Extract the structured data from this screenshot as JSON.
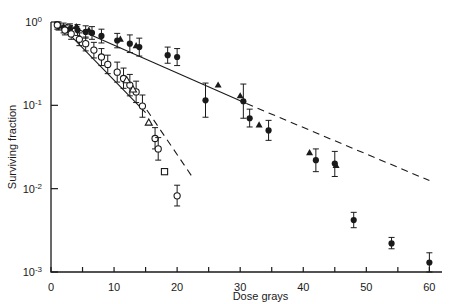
{
  "figure": {
    "background": "#ffffff",
    "ink": "#1a1a1a"
  },
  "axes": {
    "x": {
      "label": "Dose  grays",
      "min": 0,
      "max": 62,
      "tick_step": 5,
      "labeled_ticks": [
        0,
        10,
        20,
        30,
        40,
        50,
        60
      ],
      "labeled_tick_text": [
        "0",
        "10",
        "20",
        "30",
        "40",
        "50",
        "60"
      ]
    },
    "y": {
      "label": "Surviving fraction",
      "scale": "log10",
      "min": 0.001,
      "max": 1.0,
      "decade_ticks": [
        1,
        0.1,
        0.01,
        0.001
      ],
      "decade_tick_text": [
        "10⁰",
        "10⁻¹",
        "10⁻²",
        "10⁻³"
      ],
      "mantissa": [
        "0",
        "-1",
        "-2",
        "-3"
      ]
    }
  },
  "chart_data": {
    "type": "scatter",
    "title": "",
    "xlabel": "Dose  grays",
    "ylabel": "Surviving fraction",
    "xlim": [
      0,
      62
    ],
    "ylim": [
      0.001,
      1.0
    ],
    "yscale": "log",
    "grid": false,
    "legend": "none",
    "series": [
      {
        "name": "resistant-filled-circles",
        "marker": "filled-circle",
        "points": [
          {
            "x": 1.2,
            "y": 0.9,
            "yerr_lo": 0.8,
            "yerr_hi": 1.0
          },
          {
            "x": 2.0,
            "y": 0.85,
            "yerr_lo": 0.74,
            "yerr_hi": 0.97
          },
          {
            "x": 3.0,
            "y": 0.82,
            "yerr_lo": 0.71,
            "yerr_hi": 0.95
          },
          {
            "x": 4.2,
            "y": 0.8,
            "yerr_lo": 0.69,
            "yerr_hi": 0.93
          },
          {
            "x": 5.5,
            "y": 0.76,
            "yerr_lo": 0.64,
            "yerr_hi": 0.9
          },
          {
            "x": 6.5,
            "y": 0.74,
            "yerr_lo": 0.62,
            "yerr_hi": 0.88
          },
          {
            "x": 8.0,
            "y": 0.68,
            "yerr_lo": 0.56,
            "yerr_hi": 0.82
          },
          {
            "x": 10.5,
            "y": 0.6,
            "yerr_lo": 0.49,
            "yerr_hi": 0.73
          },
          {
            "x": 12.5,
            "y": 0.55,
            "yerr_lo": 0.43,
            "yerr_hi": 0.7
          },
          {
            "x": 14.0,
            "y": 0.5,
            "yerr_lo": 0.39,
            "yerr_hi": 0.64
          },
          {
            "x": 18.5,
            "y": 0.4,
            "yerr_lo": 0.32,
            "yerr_hi": 0.5
          },
          {
            "x": 20.0,
            "y": 0.38,
            "yerr_lo": 0.3,
            "yerr_hi": 0.48
          },
          {
            "x": 24.5,
            "y": 0.115,
            "yerr_lo": 0.072,
            "yerr_hi": 0.185
          },
          {
            "x": 30.5,
            "y": 0.112,
            "yerr_lo": 0.07,
            "yerr_hi": 0.18
          },
          {
            "x": 31.5,
            "y": 0.07,
            "yerr_lo": 0.055,
            "yerr_hi": 0.09
          },
          {
            "x": 34.5,
            "y": 0.05,
            "yerr_lo": 0.038,
            "yerr_hi": 0.066
          },
          {
            "x": 42.0,
            "y": 0.022,
            "yerr_lo": 0.016,
            "yerr_hi": 0.03
          },
          {
            "x": 45.0,
            "y": 0.02,
            "yerr_lo": 0.014,
            "yerr_hi": 0.028
          },
          {
            "x": 48.0,
            "y": 0.0042,
            "yerr_lo": 0.0034,
            "yerr_hi": 0.0052
          },
          {
            "x": 54.0,
            "y": 0.0022,
            "yerr_lo": 0.0019,
            "yerr_hi": 0.0026
          },
          {
            "x": 60.0,
            "y": 0.0013,
            "yerr_lo": 0.001,
            "yerr_hi": 0.0017
          }
        ]
      },
      {
        "name": "resistant-filled-triangles",
        "marker": "filled-triangle",
        "points": [
          {
            "x": 4.0,
            "y": 0.88
          },
          {
            "x": 6.0,
            "y": 0.8
          },
          {
            "x": 11.0,
            "y": 0.62
          },
          {
            "x": 13.5,
            "y": 0.52
          },
          {
            "x": 26.5,
            "y": 0.175
          },
          {
            "x": 30.0,
            "y": 0.13
          },
          {
            "x": 33.0,
            "y": 0.058
          },
          {
            "x": 41.0,
            "y": 0.027
          },
          {
            "x": 45.2,
            "y": 0.019
          }
        ]
      },
      {
        "name": "sensitive-open-circles",
        "marker": "open-circle",
        "points": [
          {
            "x": 1.0,
            "y": 0.92,
            "yerr_lo": 0.82,
            "yerr_hi": 1.0
          },
          {
            "x": 2.2,
            "y": 0.8,
            "yerr_lo": 0.7,
            "yerr_hi": 0.92
          },
          {
            "x": 3.2,
            "y": 0.72,
            "yerr_lo": 0.62,
            "yerr_hi": 0.84
          },
          {
            "x": 4.5,
            "y": 0.62,
            "yerr_lo": 0.52,
            "yerr_hi": 0.74
          },
          {
            "x": 5.5,
            "y": 0.55,
            "yerr_lo": 0.45,
            "yerr_hi": 0.66
          },
          {
            "x": 6.8,
            "y": 0.46,
            "yerr_lo": 0.37,
            "yerr_hi": 0.57
          },
          {
            "x": 8.0,
            "y": 0.38,
            "yerr_lo": 0.3,
            "yerr_hi": 0.48
          },
          {
            "x": 9.0,
            "y": 0.31,
            "yerr_lo": 0.24,
            "yerr_hi": 0.4
          },
          {
            "x": 10.5,
            "y": 0.25,
            "yerr_lo": 0.19,
            "yerr_hi": 0.33
          },
          {
            "x": 11.5,
            "y": 0.21,
            "yerr_lo": 0.16,
            "yerr_hi": 0.28
          },
          {
            "x": 12.5,
            "y": 0.175,
            "yerr_lo": 0.13,
            "yerr_hi": 0.235
          },
          {
            "x": 13.5,
            "y": 0.145,
            "yerr_lo": 0.108,
            "yerr_hi": 0.195
          },
          {
            "x": 14.5,
            "y": 0.098,
            "yerr_lo": 0.072,
            "yerr_hi": 0.133
          },
          {
            "x": 16.5,
            "y": 0.04,
            "yerr_lo": 0.03,
            "yerr_hi": 0.054
          },
          {
            "x": 17.0,
            "y": 0.03,
            "yerr_lo": 0.022,
            "yerr_hi": 0.041
          },
          {
            "x": 20.0,
            "y": 0.0082,
            "yerr_lo": 0.0062,
            "yerr_hi": 0.011
          }
        ]
      },
      {
        "name": "sensitive-open-triangles",
        "marker": "open-triangle",
        "points": [
          {
            "x": 12.0,
            "y": 0.2
          },
          {
            "x": 13.0,
            "y": 0.155
          },
          {
            "x": 15.5,
            "y": 0.062
          }
        ]
      },
      {
        "name": "sensitive-open-square",
        "marker": "open-square",
        "points": [
          {
            "x": 18.0,
            "y": 0.016
          }
        ]
      }
    ],
    "fit_lines": [
      {
        "name": "resistant-fit-solid",
        "style": "solid",
        "from": {
          "x": 3.0,
          "y": 0.9
        },
        "to": {
          "x": 31.0,
          "y": 0.105
        }
      },
      {
        "name": "resistant-fit-dashed-extrapolation",
        "style": "dashed",
        "from": {
          "x": 31.0,
          "y": 0.105
        },
        "to": {
          "x": 60.0,
          "y": 0.0125
        }
      },
      {
        "name": "sensitive-fit-solid",
        "style": "solid",
        "from": {
          "x": 2.0,
          "y": 0.84
        },
        "to": {
          "x": 15.0,
          "y": 0.082
        }
      },
      {
        "name": "sensitive-fit-dashed-extrapolation",
        "style": "dashed",
        "from": {
          "x": 15.2,
          "y": 0.088
        },
        "to": {
          "x": 22.5,
          "y": 0.0135
        }
      },
      {
        "name": "shoulder-dashed-cap",
        "style": "dashed",
        "from": {
          "x": 0.5,
          "y": 0.98
        },
        "to": {
          "x": 4.5,
          "y": 0.88
        }
      }
    ]
  }
}
